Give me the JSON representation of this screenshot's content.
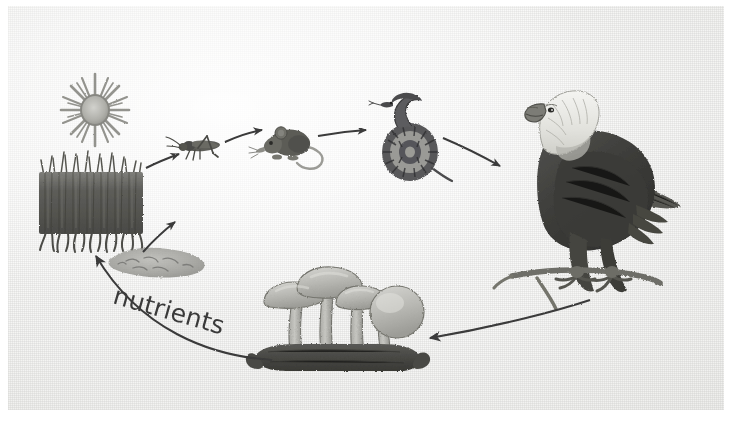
{
  "diagram": {
    "style": "grayscale scanned textbook illustration",
    "background_color": "#f2f2f0",
    "ink_color": "#3a3a3a",
    "labels": [
      {
        "id": "nutrients",
        "text": "nutrients"
      }
    ],
    "nodes": [
      {
        "id": "sun",
        "name": "sun",
        "role": "energy source",
        "label": ""
      },
      {
        "id": "grass",
        "name": "grass",
        "role": "producer",
        "label": ""
      },
      {
        "id": "grasshopper",
        "name": "grasshopper",
        "role": "primary consumer",
        "label": ""
      },
      {
        "id": "mouse",
        "name": "mouse",
        "role": "secondary consumer",
        "label": ""
      },
      {
        "id": "snake",
        "name": "snake",
        "role": "tertiary consumer",
        "label": ""
      },
      {
        "id": "eagle",
        "name": "bald eagle",
        "role": "apex predator",
        "label": ""
      },
      {
        "id": "mushrooms",
        "name": "mushrooms",
        "role": "decomposer",
        "label": ""
      },
      {
        "id": "bacteria",
        "name": "bacteria",
        "role": "decomposer",
        "label": ""
      }
    ],
    "arrows": [
      {
        "from": "grass",
        "to": "grasshopper",
        "label": ""
      },
      {
        "from": "grasshopper",
        "to": "mouse",
        "label": ""
      },
      {
        "from": "mouse",
        "to": "snake",
        "label": ""
      },
      {
        "from": "snake",
        "to": "eagle",
        "label": ""
      },
      {
        "from": "eagle",
        "to": "mushrooms",
        "label": ""
      },
      {
        "from": "mushrooms",
        "to": "grass",
        "label": "nutrients"
      }
    ]
  }
}
